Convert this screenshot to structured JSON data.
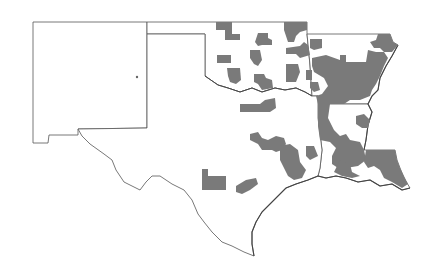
{
  "map": {
    "title": "South Central United States county map",
    "region_states": [
      "New Mexico",
      "Oklahoma",
      "Texas",
      "Arkansas",
      "Louisiana"
    ],
    "legend": null,
    "colors": {
      "background": "#ffffff",
      "state_border": "#555555",
      "highlighted_county": "#7a7a7a",
      "unshaded": "#ffffff"
    },
    "highlighted_regions_description": "Gray shaded counties concentrated in central/eastern Oklahoma, most of eastern Arkansas, much of southern Louisiana, and scattered clusters in north, central and east Texas; New Mexico has no shaded counties except a single dot."
  }
}
